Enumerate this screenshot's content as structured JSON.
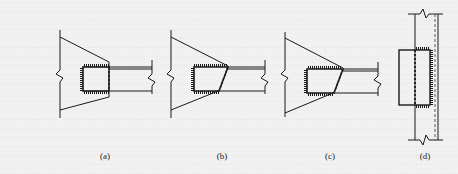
{
  "figure": {
    "line_color": "#1a1a1a",
    "background_color": "#f1f1f1",
    "panels": [
      {
        "id": "a",
        "label": "(a)",
        "label_x": 105,
        "label_y": 151
      },
      {
        "id": "b",
        "label": "(b)",
        "label_x": 222,
        "label_y": 151
      },
      {
        "id": "c",
        "label": "(c)",
        "label_x": 330,
        "label_y": 151
      },
      {
        "id": "d",
        "label": "(d)",
        "label_x": 425,
        "label_y": 151
      }
    ]
  }
}
